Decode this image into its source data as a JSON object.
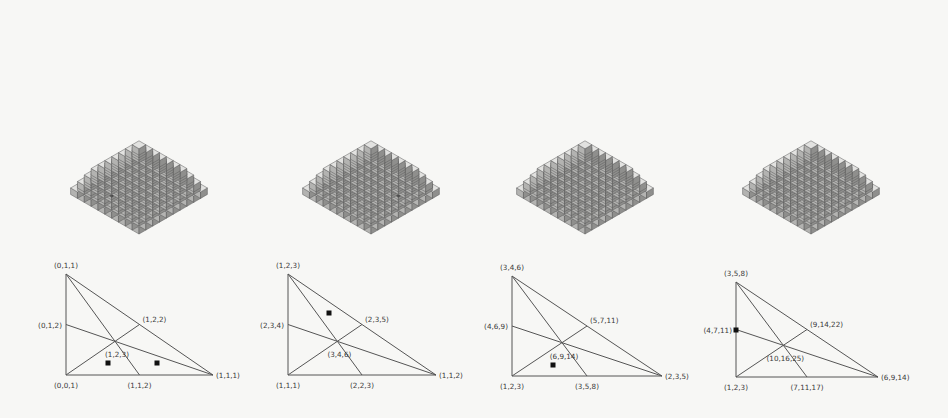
{
  "figure": {
    "colors": {
      "background": "#f7f7f5",
      "cube_top": "#e2e2e0",
      "cube_left": "#b3b3b1",
      "cube_right": "#8f8f8d",
      "cube_edge": "#5a5a5a",
      "dark_top": "#6a6a6a",
      "dark_left": "#4a4a4a",
      "dark_right": "#3a3a3a",
      "line": "#555555",
      "dot": "#111111"
    },
    "panels": [
      {
        "stack": {
          "origin_x": 139,
          "origin_y": 238,
          "cube": 7.2,
          "size": 10,
          "dark_cells": [
            [
              7,
              3
            ],
            [
              6,
              5
            ],
            [
              5,
              2
            ]
          ]
        },
        "triangle": {
          "vertices": {
            "top": [
              66,
              274
            ],
            "bl": [
              66,
              375
            ],
            "br": [
              213,
              375
            ]
          },
          "labels": {
            "top": "(0,1,1)",
            "left_mid": "(0,1,2)",
            "hyp_mid": "(1,2,2)",
            "center": "(1,2,3)",
            "bl": "(0,0,1)",
            "bottom_mid": "(1,1,2)",
            "br": "(1,1,1)"
          },
          "dots": [
            [
              108,
              363
            ],
            [
              157,
              363
            ]
          ]
        }
      },
      {
        "stack": {
          "origin_x": 371,
          "origin_y": 238,
          "cube": 7.2,
          "size": 10,
          "dark_cells": [
            [
              4,
              4
            ],
            [
              2,
              5
            ],
            [
              3,
              7
            ]
          ]
        },
        "triangle": {
          "vertices": {
            "top": [
              288,
              274
            ],
            "bl": [
              288,
              375
            ],
            "br": [
              436,
              375
            ]
          },
          "labels": {
            "top": "(1,2,3)",
            "left_mid": "(2,3,4)",
            "hyp_mid": "(2,3,5)",
            "center": "(3,4,6)",
            "bl": "(1,1,1)",
            "bottom_mid": "(2,2,3)",
            "br": "(1,1,2)"
          },
          "dots": [
            [
              329,
              313
            ]
          ]
        }
      },
      {
        "stack": {
          "origin_x": 585,
          "origin_y": 238,
          "cube": 7.2,
          "size": 10,
          "dark_cells": [
            [
              1,
              1
            ],
            [
              3,
              3
            ],
            [
              2,
              6
            ],
            [
              5,
              6
            ]
          ]
        },
        "triangle": {
          "vertices": {
            "top": [
              512,
              276
            ],
            "bl": [
              512,
              376
            ],
            "br": [
              662,
              376
            ]
          },
          "labels": {
            "top": "(3,4,6)",
            "left_mid": "(4,6,9)",
            "hyp_mid": "(5,7,11)",
            "center": "(6,9,14)",
            "bl": "(1,2,3)",
            "bottom_mid": "(3,5,8)",
            "br": "(2,3,5)"
          },
          "dots": [
            [
              553,
              365
            ]
          ]
        }
      },
      {
        "stack": {
          "origin_x": 811,
          "origin_y": 238,
          "cube": 7.2,
          "size": 10,
          "dark_cells": []
        },
        "triangle": {
          "vertices": {
            "top": [
              736,
              282
            ],
            "bl": [
              736,
              377
            ],
            "br": [
              878,
              377
            ]
          },
          "labels": {
            "top": "(3,5,8)",
            "left_mid": "(4,7,11)",
            "hyp_mid": "(9,14,22)",
            "center": "(10,16,25)",
            "bl": "(1,2,3)",
            "bottom_mid": "(7,11,17)",
            "br": "(6,9,14)"
          },
          "dots": [
            [
              736,
              330
            ]
          ]
        }
      }
    ]
  }
}
